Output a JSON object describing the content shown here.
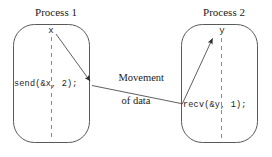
{
  "diagram": {
    "title_left": "Process 1",
    "title_right": "Process 2",
    "variable_left": "x",
    "variable_right": "y",
    "code_left": "send(&x, 2);",
    "code_right": "recv(&y, 1);",
    "middle_label_line1": "Movement",
    "middle_label_line2": "of data",
    "colors": {
      "background": "#ffffff",
      "stroke": "#4d4d4d",
      "dash_stroke": "#8a8a8a",
      "text": "#1a1a1a"
    }
  }
}
